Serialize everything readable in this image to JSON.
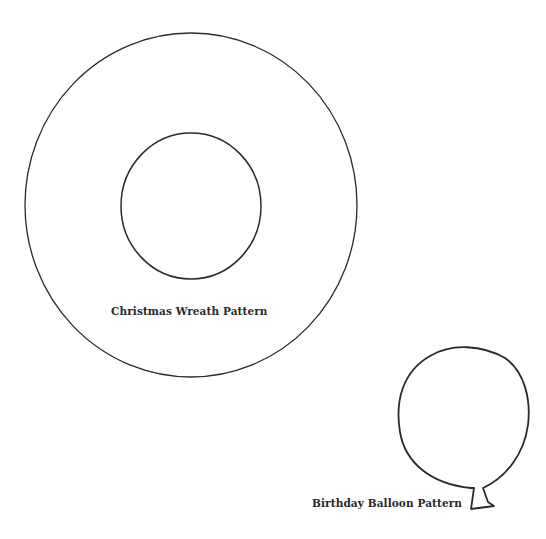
{
  "colors": {
    "stroke": "#2a2a2a",
    "background": "#ffffff"
  },
  "wreath": {
    "label": "Christmas Wreath Pattern",
    "outer": {
      "cx": 191,
      "cy": 205,
      "rx": 166,
      "ry": 172
    },
    "inner": {
      "cx": 191,
      "cy": 206,
      "rx": 70,
      "ry": 73
    }
  },
  "balloon": {
    "label": "Birthday Balloon Pattern"
  }
}
